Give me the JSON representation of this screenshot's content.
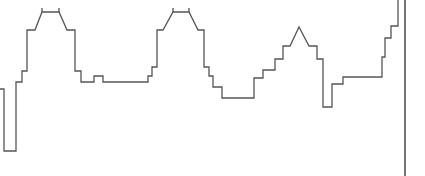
{
  "diagram": {
    "type": "skyline-waveform",
    "stroke_color": "#555555",
    "background": "#ffffff",
    "path_points": [
      [
        0,
        89
      ],
      [
        4,
        89
      ],
      [
        4,
        151
      ],
      [
        16,
        151
      ],
      [
        16,
        82
      ],
      [
        22,
        82
      ],
      [
        22,
        71
      ],
      [
        27,
        71
      ],
      [
        27,
        30
      ],
      [
        35,
        30
      ],
      [
        42,
        12
      ],
      [
        59,
        12
      ],
      [
        67,
        30
      ],
      [
        75,
        30
      ],
      [
        75,
        71
      ],
      [
        81,
        71
      ],
      [
        81,
        82
      ],
      [
        94,
        82
      ],
      [
        94,
        76
      ],
      [
        103,
        76
      ],
      [
        103,
        82
      ],
      [
        148,
        82
      ],
      [
        148,
        76
      ],
      [
        152,
        76
      ],
      [
        152,
        67
      ],
      [
        157,
        67
      ],
      [
        157,
        30
      ],
      [
        163,
        30
      ],
      [
        173,
        12
      ],
      [
        189,
        12
      ],
      [
        198,
        30
      ],
      [
        204,
        30
      ],
      [
        204,
        67
      ],
      [
        209,
        67
      ],
      [
        209,
        76
      ],
      [
        213,
        76
      ],
      [
        213,
        87
      ],
      [
        222,
        87
      ],
      [
        222,
        98
      ],
      [
        254,
        98
      ],
      [
        254,
        78
      ],
      [
        263,
        78
      ],
      [
        263,
        70
      ],
      [
        275,
        70
      ],
      [
        275,
        59
      ],
      [
        283,
        59
      ],
      [
        283,
        46
      ],
      [
        290,
        46
      ],
      [
        299,
        27
      ],
      [
        309,
        46
      ],
      [
        317,
        46
      ],
      [
        317,
        59
      ],
      [
        323,
        59
      ],
      [
        323,
        107
      ],
      [
        332,
        107
      ],
      [
        332,
        84
      ],
      [
        343,
        84
      ],
      [
        343,
        77
      ],
      [
        382,
        77
      ],
      [
        382,
        57
      ],
      [
        385,
        57
      ],
      [
        385,
        38
      ],
      [
        391,
        38
      ],
      [
        391,
        26
      ],
      [
        398,
        26
      ],
      [
        398,
        0
      ]
    ],
    "ticks": [
      [
        [
          42,
          8
        ],
        [
          42,
          12
        ]
      ],
      [
        [
          59,
          8
        ],
        [
          59,
          12
        ]
      ],
      [
        [
          173,
          8
        ],
        [
          173,
          12
        ]
      ],
      [
        [
          189,
          8
        ],
        [
          189,
          12
        ]
      ]
    ],
    "border_line": [
      [
        405,
        0
      ],
      [
        405,
        176
      ]
    ]
  }
}
